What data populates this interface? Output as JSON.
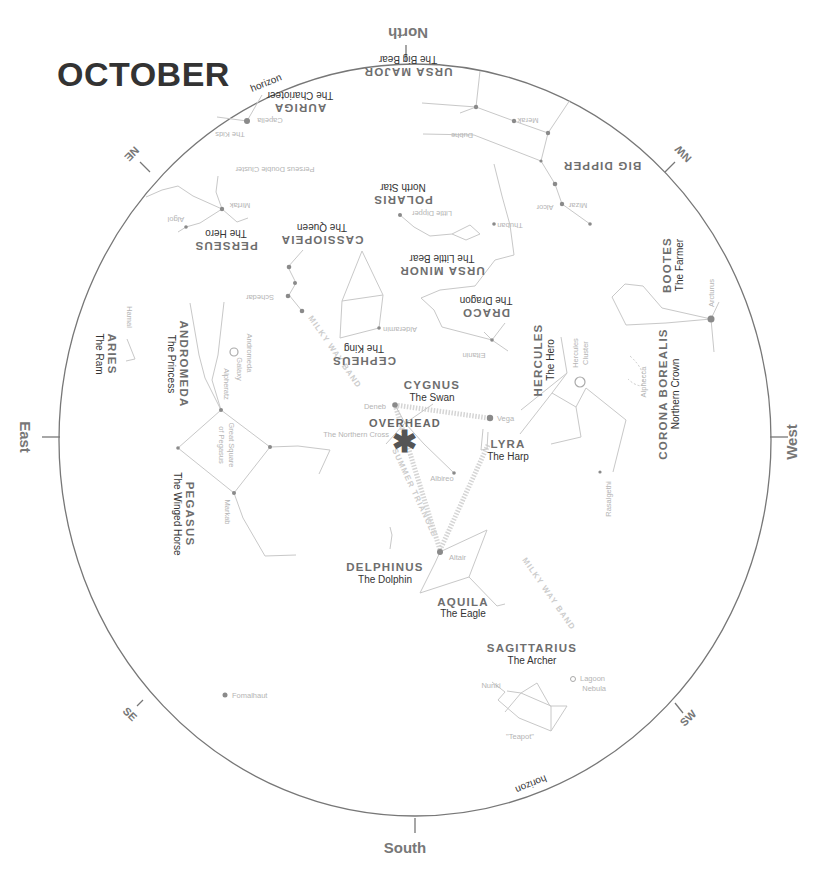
{
  "title": "OCTOBER",
  "horizon_label": "horizon",
  "directions": {
    "north": "North",
    "south": "South",
    "east": "East",
    "west": "West",
    "ne": "NE",
    "nw": "NW",
    "se": "SE",
    "sw": "SW"
  },
  "overhead": "OVERHEAD",
  "bands": {
    "milky_way_1": "MILKY WAY BAND",
    "milky_way_2": "MILKY WAY BAND",
    "summer_triangle": "SUMMER TRIANGLE"
  },
  "constellations": {
    "ursa_major": {
      "name": "URSA MAJOR",
      "sub": "The Big Bear"
    },
    "big_dipper": {
      "name": "BIG DIPPER"
    },
    "auriga": {
      "name": "AURIGA",
      "sub": "The Charioteer"
    },
    "polaris": {
      "name": "POLARIS",
      "sub": "North Star"
    },
    "perseus": {
      "name": "PERSEUS",
      "sub": "The Hero"
    },
    "cassiopeia": {
      "name": "CASSIOPEIA",
      "sub": "The Queen"
    },
    "ursa_minor": {
      "name": "URSA MINOR",
      "sub": "The Little Bear"
    },
    "draco": {
      "name": "DRACO",
      "sub": "The Dragon"
    },
    "cepheus": {
      "name": "CEPHEUS",
      "sub": "The King"
    },
    "bootes": {
      "name": "BOOTES",
      "sub": "The Farmer"
    },
    "hercules": {
      "name": "HERCULES",
      "sub": "The Hero"
    },
    "corona_borealis": {
      "name": "CORONA BOREALIS",
      "sub": "Northern Crown"
    },
    "aries": {
      "name": "ARIES",
      "sub": "The Ram"
    },
    "andromeda": {
      "name": "ANDROMEDA",
      "sub": "The Princess"
    },
    "cygnus": {
      "name": "CYGNUS",
      "sub": "The Swan"
    },
    "lyra": {
      "name": "LYRA",
      "sub": "The Harp"
    },
    "pegasus": {
      "name": "PEGASUS",
      "sub": "The Winged Horse"
    },
    "delphinus": {
      "name": "DELPHINUS",
      "sub": "The Dolphin"
    },
    "aquila": {
      "name": "AQUILA",
      "sub": "The Eagle"
    },
    "sagittarius": {
      "name": "SAGITTARIUS",
      "sub": "The Archer"
    }
  },
  "stars": {
    "capella": "Capella",
    "the_kids": "The Kids",
    "merak": "Merak",
    "dubhe": "Dubhe",
    "mizar": "Mizar",
    "alcor": "Alcor",
    "thuban": "Thuban",
    "little_dipper": "Little Dipper",
    "perseus_double_cluster": "Perseus Double Cluster",
    "mirfak": "Mirfak",
    "algol": "Algol",
    "schedar": "Schedar",
    "alderamin": "Alderamin",
    "eltanin": "Eltanin",
    "arcturus": "Arcturus",
    "hercules_cluster_1": "Hercules",
    "hercules_cluster_2": "Cluster",
    "alphecca": "Alphecca",
    "hamal": "Hamal",
    "andromeda_galaxy_1": "Andromeda",
    "andromeda_galaxy_2": "Galaxy",
    "alpheratz": "Alpheratz",
    "great_square_1": "Great Square",
    "great_square_2": "of Pegasus",
    "markab": "Markab",
    "deneb": "Deneb",
    "vega": "Vega",
    "northern_cross": "The Northern Cross",
    "albireo": "Albireo",
    "altair": "Altair",
    "rasalgethi": "Rasalgethi",
    "nunki": "Nunki",
    "lagoon_1": "Lagoon",
    "lagoon_2": "Nebula",
    "teapot": "\"Teapot\"",
    "fomalhaut": "Fomalhaut"
  },
  "colors": {
    "horizon": "#777777",
    "lines": "#c8c8c8",
    "stars": "#8a8a8a",
    "title": "#333333"
  }
}
